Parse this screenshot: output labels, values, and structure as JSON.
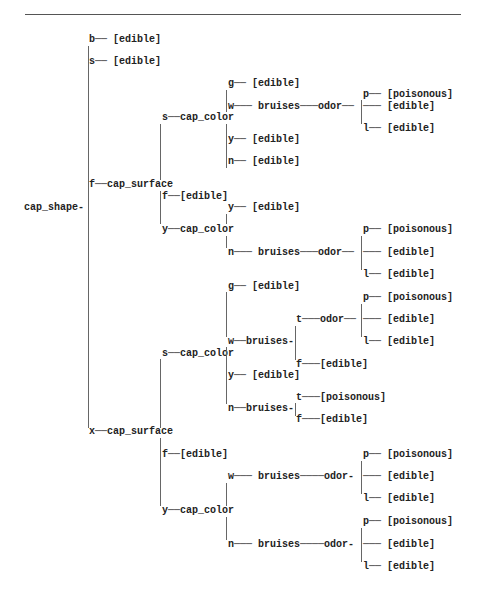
{
  "diagram": {
    "type": "decision_tree",
    "root": "cap_shape",
    "labels": [
      {
        "id": "root",
        "text": "cap_shape-",
        "x": 24,
        "y": 208
      },
      {
        "id": "b",
        "text": "b── [edible]",
        "x": 89,
        "y": 40
      },
      {
        "id": "s",
        "text": "s── [edible]",
        "x": 89,
        "y": 62
      },
      {
        "id": "f_surface",
        "text": "f──cap_surface",
        "x": 89,
        "y": 185
      },
      {
        "id": "x_surface",
        "text": "x──cap_surface",
        "x": 89,
        "y": 432
      },
      {
        "id": "f_s_color",
        "text": "s──cap_color",
        "x": 162,
        "y": 118
      },
      {
        "id": "f_f",
        "text": "f──[edible]",
        "x": 162,
        "y": 197
      },
      {
        "id": "f_y_color",
        "text": "y──cap_color",
        "x": 162,
        "y": 230
      },
      {
        "id": "fs_g",
        "text": "g── [edible]",
        "x": 228,
        "y": 84
      },
      {
        "id": "fs_w",
        "text": "w─── bruises───odor──",
        "x": 228,
        "y": 107
      },
      {
        "id": "fs_y",
        "text": "y── [edible]",
        "x": 228,
        "y": 140
      },
      {
        "id": "fs_n",
        "text": "n── [edible]",
        "x": 228,
        "y": 162
      },
      {
        "id": "fs_w_p",
        "text": "p── [poisonous]",
        "x": 363,
        "y": 95
      },
      {
        "id": "fs_w_e",
        "text": "─── [edible]",
        "x": 363,
        "y": 107
      },
      {
        "id": "fs_w_l",
        "text": "l── [edible]",
        "x": 363,
        "y": 129
      },
      {
        "id": "fy_y",
        "text": "y── [edible]",
        "x": 228,
        "y": 208
      },
      {
        "id": "fy_n",
        "text": "n─── bruises───odor──",
        "x": 228,
        "y": 253
      },
      {
        "id": "fy_n_p",
        "text": "p── [poisonous]",
        "x": 363,
        "y": 230
      },
      {
        "id": "fy_n_e",
        "text": "─── [edible]",
        "x": 363,
        "y": 253
      },
      {
        "id": "fy_n_l",
        "text": "l── [edible]",
        "x": 363,
        "y": 275
      },
      {
        "id": "x_s_color",
        "text": "s──cap_color",
        "x": 162,
        "y": 354
      },
      {
        "id": "xs_g",
        "text": "g── [edible]",
        "x": 228,
        "y": 287
      },
      {
        "id": "xs_w",
        "text": "w──bruises-",
        "x": 228,
        "y": 342
      },
      {
        "id": "xs_w_t",
        "text": "t───odor──",
        "x": 296,
        "y": 320
      },
      {
        "id": "xs_w_t_p",
        "text": "p── [poisonous]",
        "x": 363,
        "y": 298
      },
      {
        "id": "xs_w_t_e",
        "text": "─── [edible]",
        "x": 363,
        "y": 320
      },
      {
        "id": "xs_w_t_l",
        "text": "l── [edible]",
        "x": 363,
        "y": 342
      },
      {
        "id": "xs_w_f",
        "text": "f───[edible]",
        "x": 296,
        "y": 365
      },
      {
        "id": "xs_y",
        "text": "y── [edible]",
        "x": 228,
        "y": 376
      },
      {
        "id": "xs_n",
        "text": "n──bruises-",
        "x": 228,
        "y": 409
      },
      {
        "id": "xs_n_t",
        "text": "t───[poisonous]",
        "x": 296,
        "y": 398
      },
      {
        "id": "xs_n_f",
        "text": "f───[edible]",
        "x": 296,
        "y": 420
      },
      {
        "id": "x_f",
        "text": "f──[edible]",
        "x": 162,
        "y": 455
      },
      {
        "id": "x_y_color",
        "text": "y──cap_color",
        "x": 162,
        "y": 511
      },
      {
        "id": "xy_w",
        "text": "w─── bruises────odor-",
        "x": 228,
        "y": 477
      },
      {
        "id": "xy_w_p",
        "text": "p── [poisonous]",
        "x": 363,
        "y": 455
      },
      {
        "id": "xy_w_e",
        "text": "─── [edible]",
        "x": 363,
        "y": 477
      },
      {
        "id": "xy_w_l",
        "text": "l── [edible]",
        "x": 363,
        "y": 499
      },
      {
        "id": "xy_n",
        "text": "n─── bruises────odor-",
        "x": 228,
        "y": 545
      },
      {
        "id": "xy_n_p",
        "text": "p── [poisonous]",
        "x": 363,
        "y": 522
      },
      {
        "id": "xy_n_e",
        "text": "─── [edible]",
        "x": 363,
        "y": 545
      },
      {
        "id": "xy_n_l",
        "text": "l── [edible]",
        "x": 363,
        "y": 567
      }
    ],
    "vlines": [
      {
        "x": 88,
        "y1": 46,
        "y2": 428
      },
      {
        "x": 160,
        "y1": 124,
        "y2": 180
      },
      {
        "x": 160,
        "y1": 191,
        "y2": 224
      },
      {
        "x": 226,
        "y1": 90,
        "y2": 112
      },
      {
        "x": 226,
        "y1": 124,
        "y2": 168
      },
      {
        "x": 226,
        "y1": 214,
        "y2": 224
      },
      {
        "x": 226,
        "y1": 236,
        "y2": 248
      },
      {
        "x": 361,
        "y1": 100,
        "y2": 124
      },
      {
        "x": 361,
        "y1": 236,
        "y2": 270
      },
      {
        "x": 160,
        "y1": 359,
        "y2": 428
      },
      {
        "x": 160,
        "y1": 438,
        "y2": 506
      },
      {
        "x": 226,
        "y1": 292,
        "y2": 337
      },
      {
        "x": 226,
        "y1": 347,
        "y2": 404
      },
      {
        "x": 295,
        "y1": 326,
        "y2": 360
      },
      {
        "x": 295,
        "y1": 403,
        "y2": 416
      },
      {
        "x": 361,
        "y1": 304,
        "y2": 337
      },
      {
        "x": 226,
        "y1": 483,
        "y2": 506
      },
      {
        "x": 226,
        "y1": 517,
        "y2": 540
      },
      {
        "x": 361,
        "y1": 461,
        "y2": 494
      },
      {
        "x": 361,
        "y1": 528,
        "y2": 562
      }
    ]
  }
}
